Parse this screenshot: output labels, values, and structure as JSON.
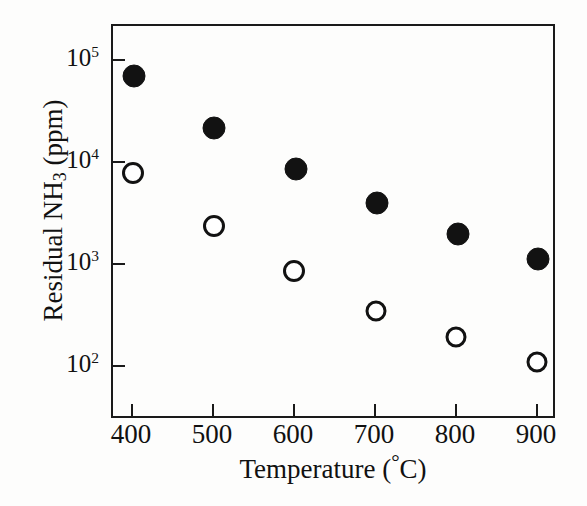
{
  "figure": {
    "background_color": "#fdfdfc",
    "axis_color": "#1a1a1a",
    "marker_color": "#121212"
  },
  "axes": {
    "x_title_text": "Temperature (",
    "x_title_degree": "°",
    "x_title_tail": "C)",
    "y_title_lead": "Residual NH",
    "y_title_sub": "3",
    "y_title_tail": " (ppm)",
    "x_tick_labels": [
      "400",
      "500",
      "600",
      "700",
      "800",
      "900"
    ],
    "y_tick_mantissa": "10",
    "y_tick_exponents": [
      "5",
      "4",
      "3",
      "2"
    ],
    "y_tick_labels": [
      "10⁵",
      "10⁴",
      "10³",
      "10²"
    ]
  },
  "chart_data": {
    "type": "scatter",
    "title": "",
    "xlabel": "Temperature (°C)",
    "ylabel": "Residual NH3 (ppm)",
    "x": [
      400,
      500,
      600,
      700,
      800,
      900
    ],
    "xlim": [
      350,
      950
    ],
    "ylim": [
      50,
      200000
    ],
    "yscale": "log",
    "xscale": "linear",
    "grid": false,
    "legend": "none",
    "series": [
      {
        "name": "filled-circles",
        "marker": "filled-circle",
        "color": "#121212",
        "values": [
          75000,
          24000,
          9600,
          4600,
          2200,
          1250
        ]
      },
      {
        "name": "open-circles",
        "marker": "open-circle",
        "color": "#121212",
        "values": [
          8000,
          2700,
          980,
          400,
          220,
          125
        ]
      }
    ]
  },
  "points": [
    {
      "series": "filled-circles",
      "x": 400,
      "y": 75000,
      "px": 134,
      "py": 76,
      "d": 23,
      "type": "filled"
    },
    {
      "series": "filled-circles",
      "x": 500,
      "y": 24000,
      "px": 214,
      "py": 128,
      "d": 23,
      "type": "filled"
    },
    {
      "series": "filled-circles",
      "x": 600,
      "y": 9600,
      "px": 296,
      "py": 169,
      "d": 23,
      "type": "filled"
    },
    {
      "series": "filled-circles",
      "x": 700,
      "y": 4600,
      "px": 377,
      "py": 203,
      "d": 23,
      "type": "filled"
    },
    {
      "series": "filled-circles",
      "x": 800,
      "y": 2200,
      "px": 458,
      "py": 234,
      "d": 23,
      "type": "filled"
    },
    {
      "series": "filled-circles",
      "x": 900,
      "y": 1250,
      "px": 538,
      "py": 259,
      "d": 23,
      "type": "filled"
    },
    {
      "series": "open-circles",
      "x": 400,
      "y": 8000,
      "px": 133,
      "py": 173,
      "d": 22,
      "type": "open"
    },
    {
      "series": "open-circles",
      "x": 500,
      "y": 2700,
      "px": 214,
      "py": 226,
      "d": 22,
      "type": "open"
    },
    {
      "series": "open-circles",
      "x": 600,
      "y": 980,
      "px": 294,
      "py": 271,
      "d": 22,
      "type": "open"
    },
    {
      "series": "open-circles",
      "x": 700,
      "y": 400,
      "px": 376,
      "py": 311,
      "d": 21,
      "type": "open"
    },
    {
      "series": "open-circles",
      "x": 800,
      "y": 220,
      "px": 456,
      "py": 337,
      "d": 21,
      "type": "open"
    },
    {
      "series": "open-circles",
      "x": 900,
      "y": 125,
      "px": 537,
      "py": 362,
      "d": 21,
      "type": "open"
    }
  ],
  "geometry": {
    "x_tick_px": [
      131,
      212,
      293,
      374,
      455,
      536
    ],
    "y_tick_px": [
      59,
      161,
      263,
      365
    ],
    "plot_left": 111,
    "plot_top": 24,
    "plot_right": 555,
    "plot_bottom": 418
  }
}
